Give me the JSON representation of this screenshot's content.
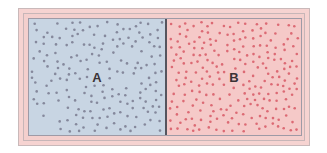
{
  "diagram": {
    "compartments": [
      {
        "id": "A",
        "label": "A",
        "particle_count": 180,
        "background_color": "#c8d5e3",
        "particle_color": "#7d7f93"
      },
      {
        "id": "B",
        "label": "B",
        "particle_count": 230,
        "background_color": "#f5c9c8",
        "particle_color": "#d95f6a"
      }
    ],
    "partition_color": "#55555e",
    "frame_color": "#f6d3d1"
  }
}
